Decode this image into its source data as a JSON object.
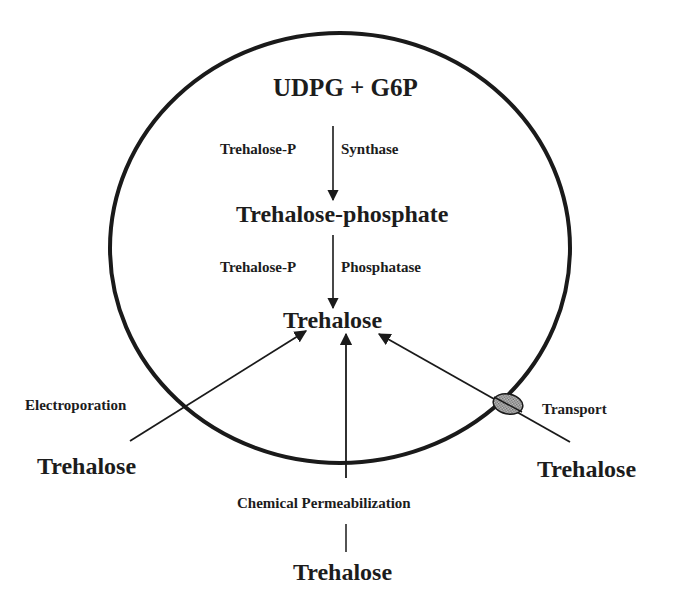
{
  "diagram": {
    "cell": {
      "shape": "circle",
      "stroke": "#1a1a1a"
    },
    "pathway": {
      "substrate": "UDPG + G6P",
      "enzyme1_left": "Trehalose-P",
      "enzyme1_right": "Synthase",
      "intermediate": "Trehalose-phosphate",
      "enzyme2_left": "Trehalose-P",
      "enzyme2_right": "Phosphatase",
      "product": "Trehalose"
    },
    "uptake": {
      "left": {
        "method": "Electroporation",
        "source": "Trehalose"
      },
      "bottom": {
        "method": "Chemical Permeabilization",
        "source": "Trehalose"
      },
      "right": {
        "method": "Transport",
        "source": "Trehalose",
        "transporter_color": "#9a9a9a"
      }
    }
  }
}
